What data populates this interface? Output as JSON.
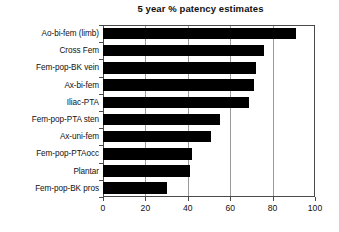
{
  "chart_data": {
    "type": "bar",
    "orientation": "horizontal",
    "title": "5 year % patency estimates",
    "xlabel": "",
    "ylabel": "",
    "xlim": [
      0,
      100
    ],
    "xticks": [
      0,
      20,
      40,
      60,
      80,
      100
    ],
    "xticklabels": [
      "0",
      "20",
      "40",
      "60",
      "80",
      "100"
    ],
    "grid": "vertical",
    "legend": "none",
    "bar_color": "#000000",
    "categories": [
      "Ao-bi-fem (limb)",
      "Cross Fem",
      "Fem-pop-BK vein",
      "Ax-bi-fem",
      "Iliac-PTA",
      "Fem-pop-PTA sten",
      "Ax-uni-fem",
      "Fem-pop-PTAocc",
      "Plantar",
      "Fem-pop-BK pros"
    ],
    "values": [
      91,
      76,
      72,
      71,
      69,
      55,
      51,
      42,
      41,
      30
    ]
  }
}
